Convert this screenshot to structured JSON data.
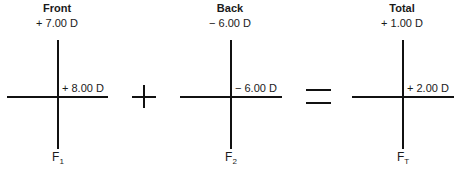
{
  "diagram": {
    "crosses": [
      {
        "id": "front",
        "title": "Front",
        "vertical_power": "+ 7.00 D",
        "horizontal_power": "+ 8.00 D",
        "label": "F",
        "subscript": "1"
      },
      {
        "id": "back",
        "title": "Back",
        "vertical_power": "− 6.00 D",
        "horizontal_power": "− 6.00 D",
        "label": "F",
        "subscript": "2"
      },
      {
        "id": "total",
        "title": "Total",
        "vertical_power": "+ 1.00 D",
        "horizontal_power": "+ 2.00 D",
        "label": "F",
        "subscript": "T"
      }
    ],
    "operators": [
      "plus",
      "equals"
    ]
  }
}
